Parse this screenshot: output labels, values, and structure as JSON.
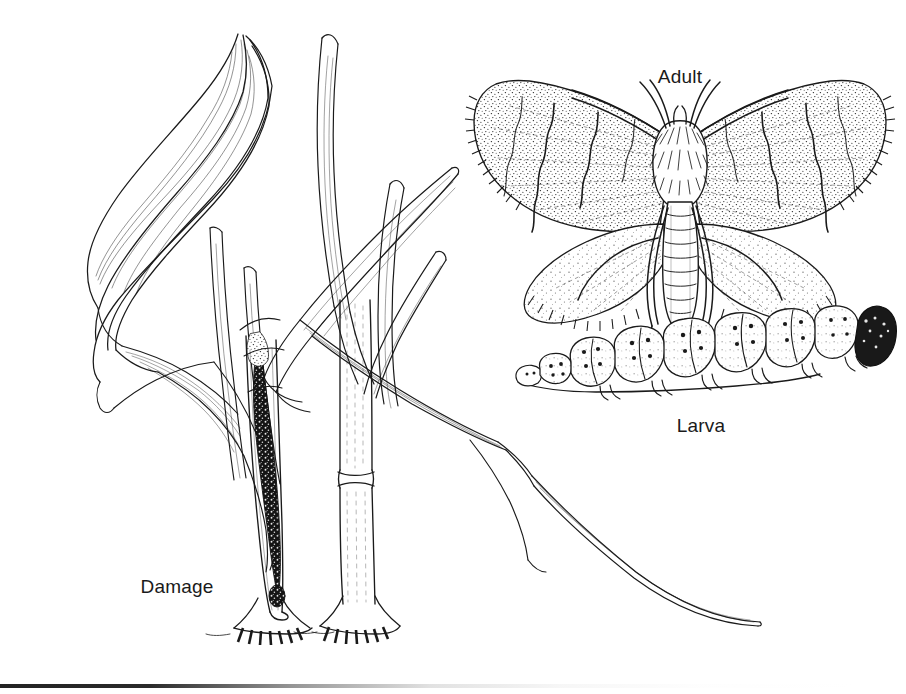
{
  "figure": {
    "kind": "scientific-line-illustration",
    "background_color": "#ffffff",
    "ink_color": "#1a1a1a",
    "width": 906,
    "height": 694
  },
  "labels": {
    "adult": "Adult",
    "larva": "Larva",
    "damage": "Damage"
  },
  "panels": [
    {
      "id": "damage",
      "label": "Damage",
      "description": "grass/rice plant with drooping leaves and a bored, tunnelled stem",
      "label_x": 177,
      "label_y": 588
    },
    {
      "id": "adult",
      "label": "Adult",
      "description": "moth with wings spread, stippled wings with wavy dark bands and fringed margins",
      "label_x": 680,
      "label_y": 78
    },
    {
      "id": "larva",
      "label": "Larva",
      "description": "caterpillar in side view with segmented body, paired dark pinacula and a dark head capsule",
      "label_x": 701,
      "label_y": 427
    }
  ],
  "details": {
    "larva_segment_count": 12,
    "larva_head_shading": "solid dark",
    "plant_stem_count": 2,
    "damage_marking": "dark frass-filled tunnel inside left stem"
  }
}
